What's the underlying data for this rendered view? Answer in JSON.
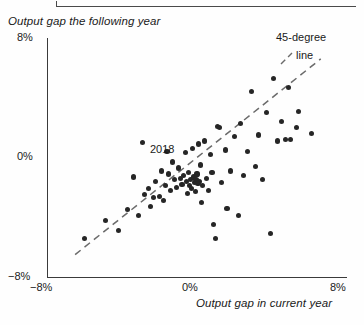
{
  "chart_data": {
    "type": "scatter",
    "title": "",
    "xlabel": "Output gap in current year",
    "ylabel": "Output gap the following year",
    "xlim": [
      -8,
      8
    ],
    "ylim": [
      -8,
      8
    ],
    "xticks": [
      "-8%",
      "0%",
      "8%"
    ],
    "yticks": [
      "-8%",
      "0%",
      "8%"
    ],
    "grid": false,
    "legend_position": "top-right",
    "annotations": [
      {
        "text": "2018",
        "x": -0.6,
        "y": 0.35
      },
      {
        "text": "45-degree",
        "x": 6.3,
        "y": 6.4
      },
      {
        "text": "line",
        "x": 6.8,
        "y": 5.2
      }
    ],
    "reference_line": {
      "label": "45-degree line",
      "style": "dashed",
      "slope": 1,
      "intercept": 0,
      "x_start": -6.5,
      "x_end": 6.6
    },
    "points": [
      {
        "x": -6.0,
        "y": -5.4
      },
      {
        "x": -4.9,
        "y": -4.2
      },
      {
        "x": -4.2,
        "y": -4.9
      },
      {
        "x": -3.7,
        "y": -3.5
      },
      {
        "x": -3.4,
        "y": -1.3
      },
      {
        "x": -3.1,
        "y": -3.9
      },
      {
        "x": -2.8,
        "y": -2.5
      },
      {
        "x": -2.6,
        "y": -2.1
      },
      {
        "x": -2.5,
        "y": -3.3
      },
      {
        "x": -2.3,
        "y": -2.7
      },
      {
        "x": -2.2,
        "y": -1.6
      },
      {
        "x": -2.0,
        "y": -2.6
      },
      {
        "x": -1.9,
        "y": -0.9
      },
      {
        "x": -1.8,
        "y": -2.9
      },
      {
        "x": -1.7,
        "y": -1.9
      },
      {
        "x": -1.6,
        "y": 0.4
      },
      {
        "x": -1.5,
        "y": -1.1
      },
      {
        "x": -1.4,
        "y": -2.2
      },
      {
        "x": -1.3,
        "y": -0.3
      },
      {
        "x": -1.2,
        "y": -1.5
      },
      {
        "x": -1.1,
        "y": -2.0
      },
      {
        "x": -1.0,
        "y": -0.7
      },
      {
        "x": -0.9,
        "y": -1.4
      },
      {
        "x": -0.8,
        "y": -1.8
      },
      {
        "x": -0.7,
        "y": -1.2
      },
      {
        "x": -0.6,
        "y": 0.35
      },
      {
        "x": -0.55,
        "y": -1.6
      },
      {
        "x": -0.5,
        "y": -2.4
      },
      {
        "x": -0.45,
        "y": -1.0
      },
      {
        "x": -0.4,
        "y": -1.9
      },
      {
        "x": -0.35,
        "y": -1.5
      },
      {
        "x": -0.3,
        "y": -2.1
      },
      {
        "x": -0.25,
        "y": 0.6
      },
      {
        "x": -0.2,
        "y": -1.3
      },
      {
        "x": -0.15,
        "y": -1.7
      },
      {
        "x": -0.1,
        "y": -2.3
      },
      {
        "x": 0.0,
        "y": -1.1
      },
      {
        "x": 0.1,
        "y": 0.9
      },
      {
        "x": 0.15,
        "y": -1.6
      },
      {
        "x": 0.2,
        "y": -0.5
      },
      {
        "x": 0.3,
        "y": -1.9
      },
      {
        "x": 0.4,
        "y": 1.1
      },
      {
        "x": 0.5,
        "y": -1.4
      },
      {
        "x": 0.6,
        "y": -2.2
      },
      {
        "x": 0.7,
        "y": 0.2
      },
      {
        "x": 0.8,
        "y": -1.0
      },
      {
        "x": 0.9,
        "y": -4.5
      },
      {
        "x": 1.0,
        "y": -5.4
      },
      {
        "x": 1.1,
        "y": 2.1
      },
      {
        "x": 1.3,
        "y": -1.7
      },
      {
        "x": 1.5,
        "y": 0.5
      },
      {
        "x": 1.6,
        "y": -3.4
      },
      {
        "x": 1.8,
        "y": -0.9
      },
      {
        "x": 2.0,
        "y": 1.4
      },
      {
        "x": 2.2,
        "y": -3.9
      },
      {
        "x": 2.3,
        "y": 2.3
      },
      {
        "x": 2.5,
        "y": -1.2
      },
      {
        "x": 2.7,
        "y": 0.4
      },
      {
        "x": 2.9,
        "y": 4.4
      },
      {
        "x": 3.1,
        "y": -0.6
      },
      {
        "x": 3.3,
        "y": 1.5
      },
      {
        "x": 3.5,
        "y": -1.5
      },
      {
        "x": 3.7,
        "y": 3.0
      },
      {
        "x": 3.9,
        "y": -5.1
      },
      {
        "x": 4.1,
        "y": 5.3
      },
      {
        "x": 4.3,
        "y": 1.1
      },
      {
        "x": 4.5,
        "y": 2.4
      },
      {
        "x": 4.7,
        "y": 1.2
      },
      {
        "x": 5.0,
        "y": 1.2
      },
      {
        "x": 5.3,
        "y": 2.0
      },
      {
        "x": 5.4,
        "y": 3.1
      },
      {
        "x": 6.1,
        "y": 1.6
      },
      {
        "x": 1.2,
        "y": 2.0
      },
      {
        "x": -2.9,
        "y": 1.0
      },
      {
        "x": 4.9,
        "y": 4.7
      },
      {
        "x": 0.25,
        "y": -3.0
      },
      {
        "x": -0.05,
        "y": -1.45
      },
      {
        "x": 0.05,
        "y": -1.75
      }
    ]
  },
  "axis": {
    "y_title": "Output gap the following year",
    "x_title": "Output gap in current year",
    "y_top": "8%",
    "y_mid": "0%",
    "y_bottom": "−8%",
    "x_left": "−8%",
    "x_mid": "0%",
    "x_right": "8%"
  },
  "legend": {
    "line1": "45-degree",
    "line2": "line"
  },
  "annotation": {
    "year": "2018"
  },
  "colors": {
    "dot": "#262626",
    "axis": "#3a3a3a",
    "dashed_line": "#6b6b6b",
    "background": "#fefefe"
  }
}
